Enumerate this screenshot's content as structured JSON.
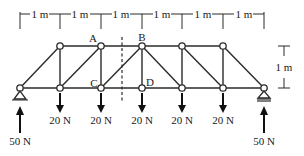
{
  "diagram": {
    "type": "truss",
    "dimensions": {
      "span_labels": [
        "1 m",
        "1 m",
        "1 m",
        "1 m",
        "1 m",
        "1 m"
      ],
      "height_label": "1 m"
    },
    "node_labels": {
      "A": "A",
      "B": "B",
      "C": "C",
      "D": "D"
    },
    "loads": [
      {
        "label": "20 N",
        "direction": "down"
      },
      {
        "label": "20 N",
        "direction": "down"
      },
      {
        "label": "20 N",
        "direction": "down"
      },
      {
        "label": "20 N",
        "direction": "down"
      },
      {
        "label": "20 N",
        "direction": "down"
      }
    ],
    "reactions": [
      {
        "label": "50 N",
        "direction": "up",
        "support": "pin"
      },
      {
        "label": "50 N",
        "direction": "up",
        "support": "roller"
      }
    ],
    "section_cut": "dashed vertical line between A–B and C–D"
  }
}
